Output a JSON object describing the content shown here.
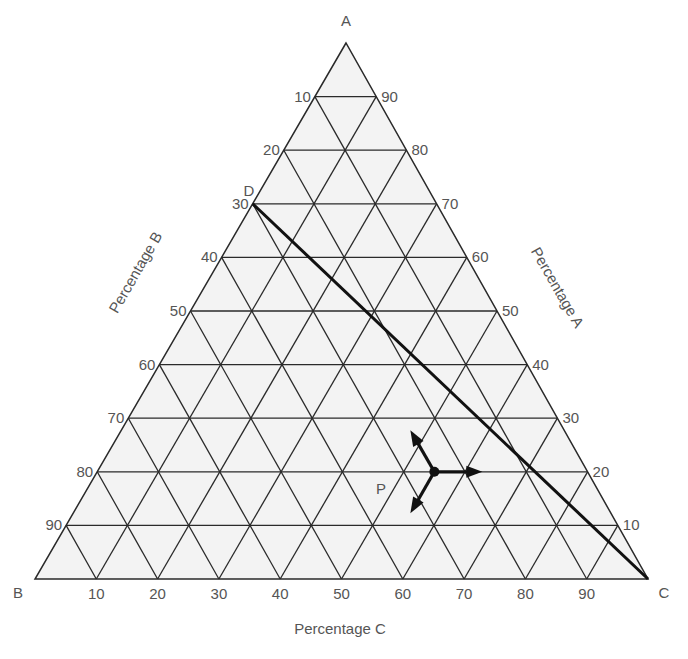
{
  "diagram": {
    "type": "ternary",
    "vertices": {
      "A": "A",
      "B": "B",
      "C": "C"
    },
    "axis_titles": {
      "a": "Percentage A",
      "b": "Percentage B",
      "c": "Percentage C"
    },
    "left_ticks": [
      "10",
      "20",
      "30",
      "40",
      "50",
      "60",
      "70",
      "80",
      "90"
    ],
    "right_ticks": [
      "90",
      "80",
      "70",
      "60",
      "50",
      "40",
      "30",
      "20",
      "10"
    ],
    "bottom_ticks": [
      "10",
      "20",
      "30",
      "40",
      "50",
      "60",
      "70",
      "80",
      "90"
    ],
    "grid_step_percent": 10,
    "points": {
      "D": {
        "label": "D",
        "A": 70,
        "B": 30,
        "C": 0
      },
      "P": {
        "label": "P",
        "A": 20,
        "B": 25,
        "C": 55
      }
    },
    "line": {
      "from": "D",
      "to": "C"
    },
    "arrows_from_P": [
      "up-left",
      "right",
      "down-left"
    ],
    "colors": {
      "fill": "#f3f3f3",
      "grid": "#2a2a2a",
      "label": "#555555",
      "line": "#111111"
    }
  },
  "chart_data": {
    "type": "ternary",
    "title": "",
    "axes": [
      "Percentage A",
      "Percentage B",
      "Percentage C"
    ],
    "ticks": [
      10,
      20,
      30,
      40,
      50,
      60,
      70,
      80,
      90
    ],
    "points": [
      {
        "label": "D",
        "A": 70,
        "B": 30,
        "C": 0
      },
      {
        "label": "P",
        "A": 20,
        "B": 25,
        "C": 55
      }
    ],
    "lines": [
      {
        "from": "D",
        "to": "C"
      }
    ],
    "grid": true
  }
}
